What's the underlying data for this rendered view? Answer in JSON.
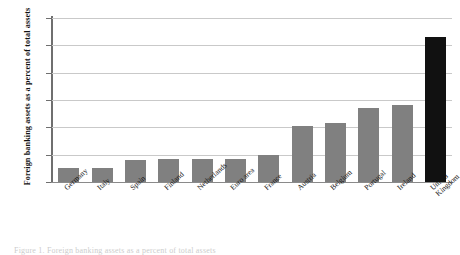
{
  "chart_data": {
    "type": "bar",
    "title": "",
    "xlabel": "",
    "ylabel": "Foreign banking assets as a percent of total assets",
    "ylim": [
      0,
      60
    ],
    "yticks": [
      0,
      10,
      20,
      30,
      40,
      50,
      60
    ],
    "grid": true,
    "legend": "none",
    "categories": [
      "Germany",
      "Italy",
      "Spain",
      "Finland",
      "Netherlands",
      "Euro area",
      "France",
      "Austria",
      "Belgium",
      "Portugal",
      "Ireland",
      "United Kingdom"
    ],
    "values": [
      5,
      5,
      8,
      8.5,
      8.5,
      8.5,
      10,
      20.5,
      21.5,
      27,
      28,
      53
    ],
    "colors": {
      "bar": "#808080",
      "highlight": "#111111",
      "grid": "#c9c9c9",
      "axis": "#6f6f6f",
      "text": "#111111"
    },
    "highlight_category": "United Kingdom"
  },
  "caption": {
    "text": "Figure 1. Foreign banking assets as a percent of total assets"
  }
}
